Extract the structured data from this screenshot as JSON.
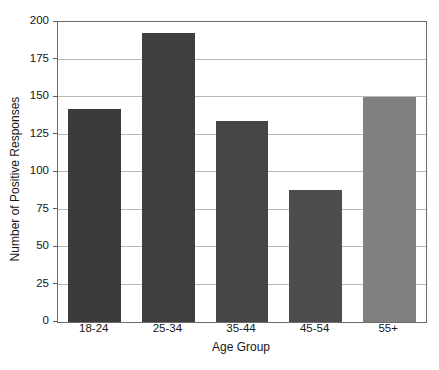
{
  "chart_data": {
    "type": "bar",
    "title": "",
    "subtitle": "",
    "xlabel": "Age Group",
    "ylabel": "Number of Positive Responses",
    "categories": [
      "18-24",
      "25-34",
      "35-44",
      "45-54",
      "55+"
    ],
    "values": [
      142,
      193,
      134,
      88,
      150
    ],
    "series": [
      {
        "name": "Number of Positive Responses",
        "values": [
          142,
          193,
          134,
          88,
          150
        ]
      }
    ],
    "bar_colors": [
      "#3b3b3b",
      "#3f3f3f",
      "#454545",
      "#4d4d4d",
      "#808080"
    ],
    "ylim": [
      0,
      200
    ],
    "yticks": [
      0,
      25,
      50,
      75,
      100,
      125,
      150,
      175,
      200
    ],
    "ytick_labels": [
      "0",
      "25",
      "50",
      "75",
      "100",
      "125",
      "150",
      "175",
      "200"
    ],
    "grid": "horizontal",
    "grid_color": "#b9b9b9",
    "legend": "none",
    "frame_color": "#6b6b6b",
    "background": "#ffffff",
    "annotations": []
  },
  "axes": {
    "y_label": "Number of Positive Responses",
    "x_label": "Age Group"
  },
  "artifact": {
    "bleed_text": ""
  }
}
